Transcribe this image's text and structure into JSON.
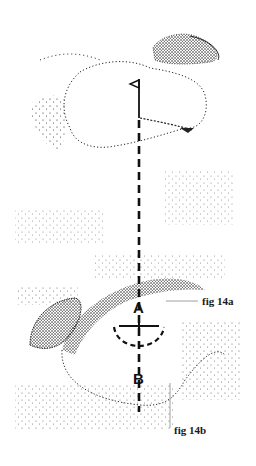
{
  "figure": {
    "labels": {
      "fig_a": "fig 14a",
      "fig_b": "fig 14b",
      "point_a": "A",
      "point_b": "B"
    },
    "colors": {
      "ink": "#111111",
      "leader": "#888888",
      "background": "#ffffff"
    }
  }
}
